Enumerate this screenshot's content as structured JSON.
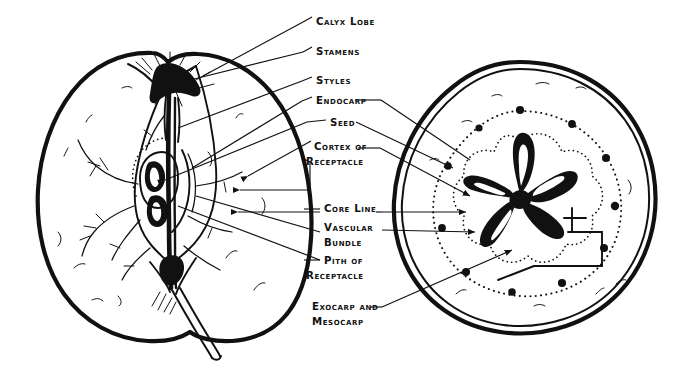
{
  "figure": {
    "background_color": "#ffffff",
    "ink_color": "#111111",
    "width": 677,
    "height": 374
  },
  "labels": [
    {
      "id": "calyx-lobe",
      "line1": "Calyx Lobe",
      "line2": "",
      "x": 316,
      "y": 25
    },
    {
      "id": "stamens",
      "line1": "Stamens",
      "line2": "",
      "x": 316,
      "y": 55
    },
    {
      "id": "styles",
      "line1": "Styles",
      "line2": "",
      "x": 316,
      "y": 84
    },
    {
      "id": "endocarp",
      "line1": "Endocarp",
      "line2": "",
      "x": 316,
      "y": 104
    },
    {
      "id": "seed",
      "line1": "Seed",
      "line2": "",
      "x": 330,
      "y": 126
    },
    {
      "id": "cortex",
      "line1": "Cortex of",
      "line2": "Receptacle",
      "x": 314,
      "y": 150
    },
    {
      "id": "core-line",
      "line1": "Core Line",
      "line2": "",
      "x": 324,
      "y": 212
    },
    {
      "id": "vascular",
      "line1": "Vascular",
      "line2": "Bundle",
      "x": 324,
      "y": 231
    },
    {
      "id": "pith",
      "line1": "Pith of",
      "line2": "Receptacle",
      "x": 324,
      "y": 264
    },
    {
      "id": "exocarp",
      "line1": "Exocarp and",
      "line2": "Mesocarp",
      "x": 312,
      "y": 310
    }
  ],
  "sections": {
    "left": {
      "name": "longitudinal-section",
      "cx": 163,
      "cy": 196
    },
    "right": {
      "name": "cross-section",
      "cx": 520,
      "cy": 190
    }
  },
  "cross_section": {
    "carpel_count": 5,
    "vascular_bundle_dots": 10,
    "rings": [
      "outer-dotted-vascular-ring",
      "inner-dotted-core-line"
    ]
  }
}
